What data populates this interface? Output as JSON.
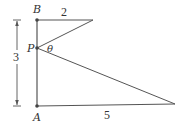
{
  "diagram": {
    "points": {
      "B": {
        "label": "B"
      },
      "P": {
        "label": "P"
      },
      "A": {
        "label": "A"
      }
    },
    "angle_label": "θ",
    "lengths": {
      "top_segment": "2",
      "vertical_total": "3",
      "bottom_segment": "5"
    },
    "colors": {
      "line": "#555555",
      "point": "#444444",
      "text": "#333333"
    }
  }
}
